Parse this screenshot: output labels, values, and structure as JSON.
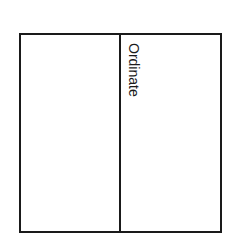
{
  "diagram": {
    "label": "Ordinate",
    "line_color": "#1a1a1a"
  }
}
